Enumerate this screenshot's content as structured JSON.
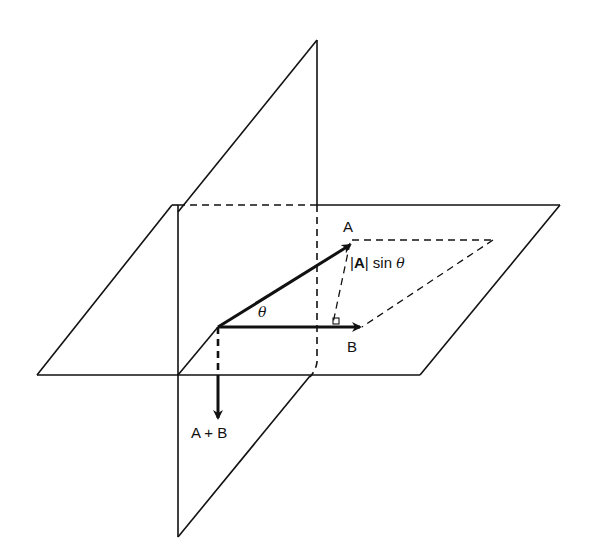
{
  "figure": {
    "colors": {
      "line": "#111111",
      "background": "#ffffff"
    },
    "labels": {
      "vector_a": "A",
      "vector_b": "B",
      "sum": "A + B",
      "theta": "θ",
      "magnitude_a": "A",
      "magnitude_bar_left": "|",
      "magnitude_bar_right": "|",
      "sin_text": "sin",
      "sin_theta": "θ"
    }
  }
}
